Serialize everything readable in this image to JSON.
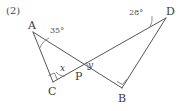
{
  "figure": {
    "problem_number": "(2)",
    "stroke_color": "#555555",
    "text_color": "#3a3a3a",
    "background_color": "#ffffff",
    "vertices": [
      {
        "name": "A",
        "label": "A",
        "x": 33,
        "y": 32,
        "label_x": 28,
        "label_y": 20
      },
      {
        "name": "C",
        "label": "C",
        "x": 53,
        "y": 82,
        "label_x": 48,
        "label_y": 86
      },
      {
        "name": "P",
        "label": "P",
        "x": 79,
        "y": 68,
        "label_x": 75,
        "label_y": 71
      },
      {
        "name": "B",
        "label": "B",
        "x": 122,
        "y": 88,
        "label_x": 118,
        "label_y": 93
      },
      {
        "name": "D",
        "label": "D",
        "x": 166,
        "y": 18,
        "label_x": 166,
        "label_y": 6
      }
    ],
    "segments": [
      {
        "name": "segment-A-C",
        "from": "A",
        "to": "C"
      },
      {
        "name": "segment-A-B",
        "from": "A",
        "to": "B"
      },
      {
        "name": "segment-C-D",
        "from": "C",
        "to": "D"
      },
      {
        "name": "segment-D-B",
        "from": "D",
        "to": "B"
      }
    ],
    "angles": [
      {
        "name": "angle-at-A",
        "vertex": "A",
        "label": "35°",
        "label_x": 50,
        "label_y": 27
      },
      {
        "name": "angle-at-D",
        "vertex": "D",
        "label": "28°",
        "label_x": 129,
        "label_y": 9
      },
      {
        "name": "angle-at-C",
        "vertex": "C",
        "label": "x",
        "label_x": 60,
        "label_y": 64
      },
      {
        "name": "angle-at-P",
        "vertex": "P",
        "label": "y",
        "label_x": 88,
        "label_y": 61
      }
    ],
    "right_angles": [
      {
        "name": "right-angle-mark-C",
        "vertex": "C"
      },
      {
        "name": "right-angle-mark-B",
        "vertex": "B"
      }
    ]
  }
}
